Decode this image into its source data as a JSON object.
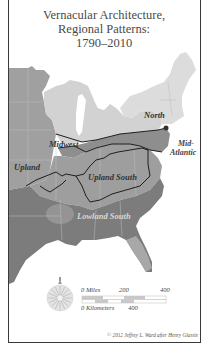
{
  "title": {
    "line1": "Vernacular Architecture,",
    "line2": "Regional Patterns:",
    "line3": "1790–2010"
  },
  "regions": [
    {
      "name": "North",
      "shade": "#d9d9d9"
    },
    {
      "name": "Mid-Atlantic",
      "line1": "Mid-",
      "line2": "Atlantic",
      "shade": "#8f8f8f"
    },
    {
      "name": "Midwest",
      "shade": "#a8a8a8"
    },
    {
      "name": "Upland",
      "shade": "#9a9a9a"
    },
    {
      "name": "Upland South",
      "shade": "#9c9c9c"
    },
    {
      "name": "Lowland South",
      "shade": "#7a7a7a"
    }
  ],
  "labels": {
    "north": "North",
    "mid_atlantic_1": "Mid-",
    "mid_atlantic_2": "Atlantic",
    "midwest": "Midwest",
    "upland": "Upland",
    "upland_south": "Upland South",
    "lowland_south": "Lowland South"
  },
  "scale": {
    "miles_label": "0 Miles",
    "miles_mid": "200",
    "miles_max": "400",
    "km_label": "0 Kilometers",
    "km_max": "400"
  },
  "compass_icon": "compass-rose-icon",
  "credit": "© 2012 Jeffrey L. Ward after Henry Glassie"
}
